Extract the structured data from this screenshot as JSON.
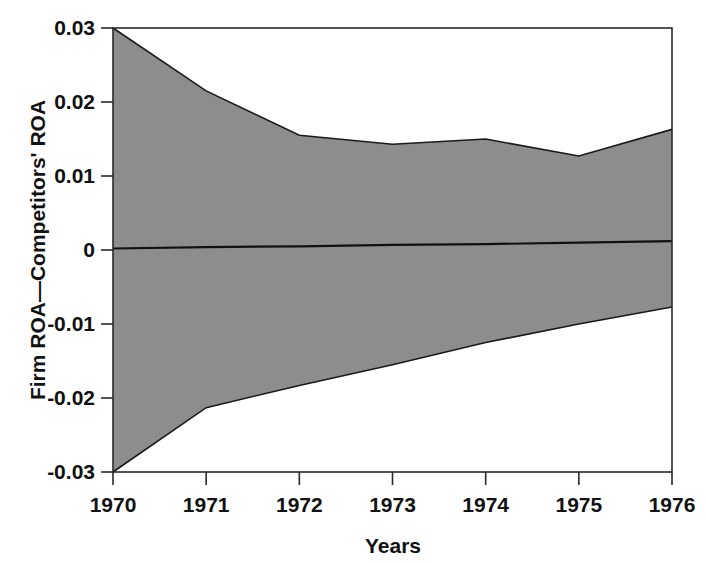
{
  "chart_data": {
    "type": "area",
    "title": "",
    "subtitle": "",
    "xlabel": "Years",
    "ylabel": "Firm ROA—Competitors' ROA",
    "x": [
      1970,
      1971,
      1972,
      1973,
      1974,
      1975,
      1976
    ],
    "categories": [
      "1970",
      "1971",
      "1972",
      "1973",
      "1974",
      "1975",
      "1976"
    ],
    "xtick_labels": [
      "1970",
      "1971",
      "1972",
      "1973",
      "1974",
      "1975",
      "1976"
    ],
    "ytick_labels": [
      "0.03",
      "0.02",
      "0.01",
      "0",
      "-0.01",
      "-0.02",
      "-0.03"
    ],
    "ytick_values": [
      0.03,
      0.02,
      0.01,
      0,
      -0.01,
      -0.02,
      -0.03
    ],
    "xlim": [
      1970,
      1976
    ],
    "ylim": [
      -0.03,
      0.03
    ],
    "grid": false,
    "legend": "none",
    "band_fill_color": "#8d8d8d",
    "line_color": "#1a1a1a",
    "background_color": "#ffffff",
    "series": [
      {
        "name": "Upper bound",
        "values": [
          0.03,
          0.0215,
          0.0155,
          0.0143,
          0.015,
          0.0127,
          0.0163
        ]
      },
      {
        "name": "Lower bound",
        "values": [
          -0.03,
          -0.0213,
          -0.0183,
          -0.0155,
          -0.0125,
          -0.01,
          -0.0077
        ]
      },
      {
        "name": "Zero reference",
        "values": [
          0.0002,
          0.0004,
          0.0005,
          0.0007,
          0.0008,
          0.001,
          0.0012
        ]
      }
    ]
  },
  "axes": {
    "y_axis_title": "Firm ROA—Competitors' ROA",
    "x_axis_title": "Years"
  }
}
